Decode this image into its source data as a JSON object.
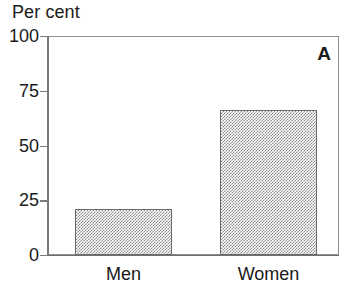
{
  "chart_data": {
    "type": "bar",
    "title": "",
    "panel_label": "A",
    "xlabel": "",
    "ylabel": "Per cent",
    "categories": [
      "Men",
      "Women"
    ],
    "values": [
      21,
      66
    ],
    "series": [
      {
        "name": "Per cent",
        "values": [
          21,
          66
        ]
      }
    ],
    "ylim": [
      0,
      100
    ],
    "yticks": [
      0,
      25,
      50,
      75,
      100
    ],
    "ytick_labels": [
      "0",
      "25",
      "50",
      "75",
      "100"
    ],
    "grid": false,
    "legend": false,
    "bar_fill_color": "#a8a8a8",
    "bar_edge_color": "#6a6a6a",
    "axis_color": "#7a7a7a",
    "text_color": "#1a1a1a"
  }
}
